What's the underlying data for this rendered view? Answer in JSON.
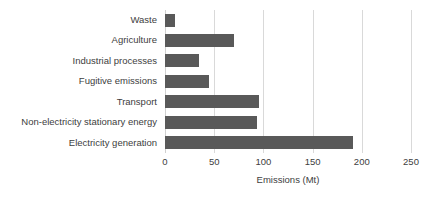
{
  "chart_data": {
    "type": "bar",
    "orientation": "horizontal",
    "title": "",
    "xlabel": "Emissions (Mt)",
    "ylabel": "",
    "categories": [
      "Waste",
      "Agriculture",
      "Industrial processes",
      "Fugitive emissions",
      "Transport",
      "Non-electricity stationary energy",
      "Electricity generation"
    ],
    "values": [
      10,
      70,
      35,
      45,
      96,
      93,
      191
    ],
    "xlim": [
      0,
      250
    ],
    "xticks": [
      0,
      50,
      100,
      150,
      200,
      250
    ],
    "xtick_labels": [
      "0",
      "50",
      "100",
      "150",
      "200",
      "250"
    ],
    "grid": "vertical",
    "legend": "none",
    "bar_color": "#595959",
    "gridline_color": "#d9d9d9",
    "text_color": "#404040",
    "background_color": "#ffffff"
  }
}
